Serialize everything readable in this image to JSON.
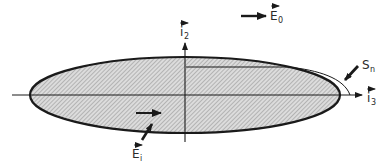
{
  "figure": {
    "labels": {
      "external_field": {
        "base": "E",
        "sub": "0",
        "vector": true
      },
      "internal_field": {
        "base": "E",
        "sub": "i",
        "vector": true
      },
      "axis_vertical": {
        "base": "i",
        "sub": "2",
        "vector": true
      },
      "axis_horizontal": {
        "base": "i",
        "sub": "3",
        "vector": true
      },
      "surface": {
        "base": "S",
        "sub": "n",
        "vector": false
      }
    },
    "colors": {
      "ink": "#1a1a1a",
      "hatch": "#8a8a8a",
      "fill": "#d9d9d9",
      "background": "#ffffff"
    }
  }
}
